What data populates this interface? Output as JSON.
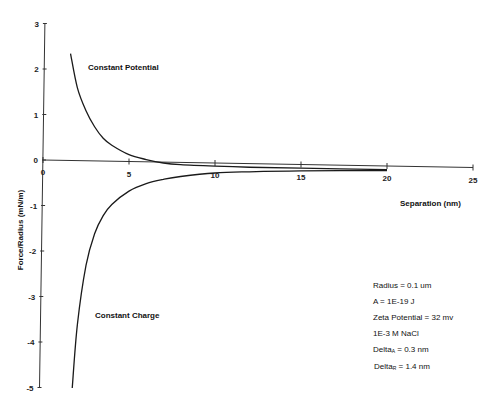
{
  "chart_data": {
    "type": "line",
    "title": "",
    "xlabel": "Separation (nm)",
    "ylabel": "Force/Radius (mN/m)",
    "xlim": [
      0,
      25
    ],
    "ylim": [
      -5,
      3
    ],
    "x_ticks": [
      0,
      5,
      10,
      15,
      20,
      25
    ],
    "y_ticks": [
      3,
      2,
      1,
      0,
      -1,
      -2,
      -3,
      -4,
      -5
    ],
    "grid": false,
    "legend": "none (curves labeled directly)",
    "series": [
      {
        "name": "Constant Potential",
        "x": [
          1.6,
          2,
          2.5,
          3,
          3.5,
          4,
          5,
          6,
          7,
          8,
          10,
          12,
          15,
          20
        ],
        "y": [
          2.35,
          1.6,
          1.1,
          0.75,
          0.5,
          0.35,
          0.15,
          0.05,
          -0.02,
          -0.05,
          -0.07,
          -0.08,
          -0.08,
          -0.08
        ]
      },
      {
        "name": "Constant Charge",
        "x": [
          1.7,
          2,
          2.5,
          3,
          3.5,
          4,
          5,
          6,
          7,
          8,
          10,
          12,
          15,
          20
        ],
        "y": [
          -5.0,
          -3.6,
          -2.3,
          -1.6,
          -1.2,
          -0.95,
          -0.65,
          -0.48,
          -0.38,
          -0.31,
          -0.22,
          -0.18,
          -0.14,
          -0.1
        ]
      }
    ],
    "annotations": [
      {
        "text": "Constant Potential",
        "x": 5.2,
        "y": 2.1
      },
      {
        "text": "Constant Charge",
        "x": 5.2,
        "y": -3.4
      }
    ]
  },
  "labels": {
    "xlabel": "Separation (nm)",
    "ylabel": "Force/Radius (mN/m)",
    "potential": "Constant Potential",
    "charge": "Constant Charge"
  },
  "parameters": [
    {
      "text": "Radius = 0.1 um"
    },
    {
      "text": "A = 1E-19 J"
    },
    {
      "text": "Zeta Potential = 32 mv"
    },
    {
      "text": "1E-3 M NaCl"
    },
    {
      "base": "Delta",
      "sub": "A",
      "rest": " = 0.3 nm"
    },
    {
      "base": "Delta",
      "sub": "R",
      "rest": " = 1.4 nm"
    }
  ],
  "style": {
    "line_color": "#1a1a1a",
    "axis_color": "#333333"
  }
}
